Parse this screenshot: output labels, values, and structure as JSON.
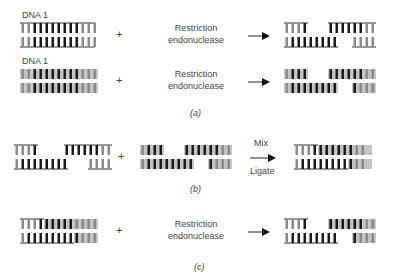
{
  "panel_a": {
    "row1": {
      "label": "DNA 1",
      "plus": "+",
      "enzyme_line1": "Restriction",
      "enzyme_line2": "endonuclease"
    },
    "row2": {
      "label": "DNA 1",
      "plus": "+",
      "enzyme_line1": "Restriction",
      "enzyme_line2": "endonuclease"
    },
    "caption": "(a)"
  },
  "panel_b": {
    "plus": "+",
    "arrow_top": "Mix",
    "arrow_bottom": "Ligate",
    "caption": "(b)"
  },
  "panel_c": {
    "plus": "+",
    "enzyme_line1": "Restriction",
    "enzyme_line2": "endonuclease",
    "caption": "(c)"
  },
  "colors": {
    "line": "#333333",
    "bar_dark": "#1a1a1a",
    "bar_gray": "#8a8a8a",
    "bg_gray": "#bdbdbd"
  }
}
